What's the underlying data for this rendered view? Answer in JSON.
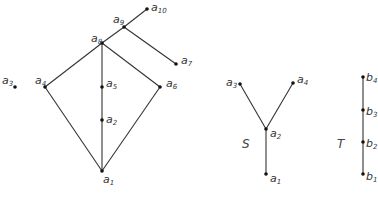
{
  "diagrams": [
    {
      "id": "main-poset",
      "nodes": [
        {
          "name": "a",
          "sub": "1",
          "x": 102,
          "y": 171,
          "lx": 103,
          "ly": 183
        },
        {
          "name": "a",
          "sub": "2",
          "x": 102,
          "y": 120,
          "lx": 106,
          "ly": 123
        },
        {
          "name": "a",
          "sub": "3",
          "x": 15,
          "y": 87,
          "lx": 2,
          "ly": 84
        },
        {
          "name": "a",
          "sub": "4",
          "x": 45,
          "y": 87,
          "lx": 35,
          "ly": 84
        },
        {
          "name": "a",
          "sub": "5",
          "x": 102,
          "y": 87,
          "lx": 106,
          "ly": 87
        },
        {
          "name": "a",
          "sub": "6",
          "x": 160,
          "y": 87,
          "lx": 166,
          "ly": 87
        },
        {
          "name": "a",
          "sub": "7",
          "x": 176,
          "y": 64,
          "lx": 181,
          "ly": 64
        },
        {
          "name": "a",
          "sub": "8",
          "x": 102,
          "y": 43,
          "lx": 91,
          "ly": 42
        },
        {
          "name": "a",
          "sub": "9",
          "x": 124,
          "y": 27,
          "lx": 113,
          "ly": 23
        },
        {
          "name": "a",
          "sub": "10",
          "x": 147,
          "y": 9,
          "lx": 151,
          "ly": 11
        }
      ],
      "edges": [
        [
          1,
          2
        ],
        [
          2,
          5
        ],
        [
          5,
          8
        ],
        [
          1,
          4
        ],
        [
          4,
          8
        ],
        [
          1,
          6
        ],
        [
          6,
          8
        ],
        [
          8,
          9
        ],
        [
          9,
          10
        ],
        [
          9,
          7
        ]
      ]
    },
    {
      "id": "S",
      "label": "S",
      "label_pos": {
        "x": 242,
        "y": 148
      },
      "nodes": [
        {
          "name": "a",
          "sub": "1",
          "x": 266,
          "y": 174,
          "lx": 270,
          "ly": 182
        },
        {
          "name": "a",
          "sub": "2",
          "x": 266,
          "y": 129,
          "lx": 270,
          "ly": 137
        },
        {
          "name": "a",
          "sub": "3",
          "x": 240,
          "y": 84,
          "lx": 226,
          "ly": 86
        },
        {
          "name": "a",
          "sub": "4",
          "x": 293,
          "y": 83,
          "lx": 297,
          "ly": 83
        }
      ],
      "edges": [
        [
          1,
          2
        ],
        [
          2,
          3
        ],
        [
          2,
          4
        ]
      ]
    },
    {
      "id": "T",
      "label": "T",
      "label_pos": {
        "x": 337,
        "y": 148
      },
      "nodes": [
        {
          "name": "b",
          "sub": "1",
          "x": 363,
          "y": 174,
          "lx": 366,
          "ly": 180
        },
        {
          "name": "b",
          "sub": "2",
          "x": 363,
          "y": 142,
          "lx": 366,
          "ly": 147
        },
        {
          "name": "b",
          "sub": "3",
          "x": 363,
          "y": 110,
          "lx": 366,
          "ly": 115
        },
        {
          "name": "b",
          "sub": "4",
          "x": 363,
          "y": 77,
          "lx": 366,
          "ly": 81
        }
      ],
      "edges": [
        [
          1,
          2
        ],
        [
          2,
          3
        ],
        [
          3,
          4
        ]
      ]
    }
  ]
}
